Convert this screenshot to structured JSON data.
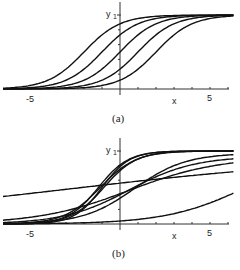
{
  "chart_data": [
    {
      "type": "line",
      "title": "",
      "caption": "(a)",
      "xlabel": "x",
      "ylabel": "y",
      "xticks": [
        -5,
        5
      ],
      "yticks": [
        1
      ],
      "xlim": [
        -6.5,
        6.3
      ],
      "ylim": [
        0,
        1
      ],
      "grid": false,
      "series": [
        {
          "name": "logistic c=-2",
          "center": -2,
          "slope": 1,
          "top": 1,
          "base": 0
        },
        {
          "name": "logistic c=-1",
          "center": -1,
          "slope": 1,
          "top": 1,
          "base": 0
        },
        {
          "name": "logistic c=0",
          "center": 0,
          "slope": 1,
          "top": 1,
          "base": 0
        },
        {
          "name": "logistic c=1",
          "center": 1,
          "slope": 1,
          "top": 1,
          "base": 0
        },
        {
          "name": "logistic c=2",
          "center": 2,
          "slope": 1,
          "top": 1,
          "base": 0
        }
      ]
    },
    {
      "type": "line",
      "title": "",
      "caption": "(b)",
      "xlabel": "x",
      "ylabel": "y",
      "xticks": [
        -5,
        5
      ],
      "yticks": [
        1
      ],
      "xlim": [
        -6.5,
        6.3
      ],
      "ylim": [
        0,
        1
      ],
      "grid": false,
      "series": [
        {
          "name": "steep 1",
          "center": -1.0,
          "slope": 1.3,
          "top": 1,
          "base": 0
        },
        {
          "name": "steep 2",
          "center": -1.2,
          "slope": 1.2,
          "top": 1,
          "base": 0
        },
        {
          "name": "steep 3",
          "center": -0.9,
          "slope": 1.1,
          "top": 1,
          "base": 0
        },
        {
          "name": "steep 4",
          "center": -1.1,
          "slope": 1.0,
          "top": 1,
          "base": 0
        },
        {
          "name": "moderate 1",
          "center": 0.8,
          "slope": 0.7,
          "top": 0.97,
          "base": 0
        },
        {
          "name": "moderate 2",
          "center": 0.5,
          "slope": 0.55,
          "top": 0.93,
          "base": 0
        },
        {
          "name": "shallow",
          "center": 0.5,
          "slope": 0.4,
          "top": 0.92,
          "base": 0
        },
        {
          "name": "near-flat",
          "center": -3.0,
          "slope": 0.12,
          "top": 0.95,
          "base": 0
        },
        {
          "name": "low",
          "center": 7.0,
          "slope": 0.45,
          "top": 1,
          "base": 0
        }
      ]
    }
  ]
}
